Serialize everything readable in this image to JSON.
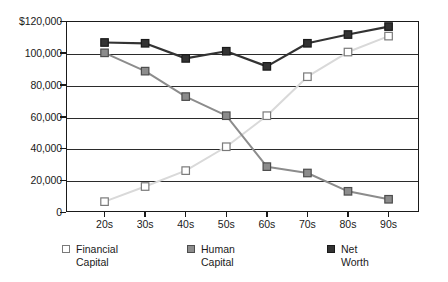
{
  "chart_data": {
    "type": "line",
    "title": "",
    "subtitle": "",
    "xlabel": "",
    "ylabel": "",
    "categories": [
      "20s",
      "30s",
      "40s",
      "50s",
      "60s",
      "70s",
      "80s",
      "90s"
    ],
    "ylim": [
      0,
      120000
    ],
    "ytick_values": [
      0,
      20000,
      40000,
      60000,
      80000,
      100000,
      120000
    ],
    "ytick_labels": [
      "0",
      "20,000",
      "40,000",
      "60,000",
      "80,000",
      "100,000",
      "$120,000"
    ],
    "grid": true,
    "legend_position": "bottom",
    "series": [
      {
        "name": "Financial Capital",
        "legend_label": "Financial\nCapital",
        "color": "#d9d9d9",
        "marker_fill": "#ffffff",
        "marker_stroke": "#7a7a7a",
        "values": [
          6500,
          16000,
          26000,
          41000,
          60500,
          85000,
          100500,
          110500
        ]
      },
      {
        "name": "Human Capital",
        "legend_label": "Human\nCapital",
        "color": "#8c8c8c",
        "marker_fill": "#8c8c8c",
        "marker_stroke": "#4d4d4d",
        "values": [
          100000,
          88500,
          72500,
          60500,
          28500,
          24500,
          13000,
          8000
        ]
      },
      {
        "name": "Net Worth",
        "legend_label": "Net\nWorth",
        "color": "#333333",
        "marker_fill": "#333333",
        "marker_stroke": "#1a1a1a",
        "values": [
          106500,
          106000,
          96500,
          101000,
          91500,
          106000,
          111500,
          116500
        ]
      }
    ]
  },
  "legend": {
    "items": [
      {
        "label": "Financial\nCapital",
        "swatch": "financial-capital-swatch"
      },
      {
        "label": "Human\nCapital",
        "swatch": "human-capital-swatch"
      },
      {
        "label": "Net\nWorth",
        "swatch": "net-worth-swatch"
      }
    ]
  }
}
